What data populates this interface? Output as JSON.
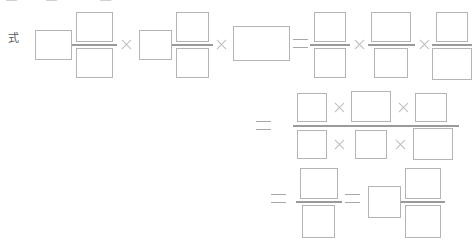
{
  "page": {
    "background_color": "#ffffff",
    "box_border_color": "#b4b4b4",
    "rule_color": "#9a9a9a",
    "operator_color": "#bdbdbd",
    "label_color": "#5b5b5b"
  },
  "top_clipped_text": "—  一    —  一一  —一",
  "row_label": {
    "text": "式",
    "meaning": "formula"
  },
  "glyphs": {
    "multiply": "×",
    "equals": "=",
    "blank_box": "□"
  },
  "worksheet": {
    "kind": "fill-in-the-blank arithmetic worked solution",
    "all_values_blank": true,
    "lines": [
      {
        "id": "line-1",
        "label": "式",
        "expression_text": "□ □/□ × □ □/□ × □ = □/□ × □/□ × □/□",
        "terms": [
          {
            "type": "mixed-number",
            "whole": "",
            "numerator": "",
            "denominator": ""
          },
          {
            "type": "operator",
            "value": "×"
          },
          {
            "type": "mixed-number",
            "whole": "",
            "numerator": "",
            "denominator": ""
          },
          {
            "type": "operator",
            "value": "×"
          },
          {
            "type": "box",
            "value": ""
          },
          {
            "type": "operator",
            "value": "="
          },
          {
            "type": "fraction",
            "numerator": "",
            "denominator": ""
          },
          {
            "type": "operator",
            "value": "×"
          },
          {
            "type": "fraction",
            "numerator": "",
            "denominator": ""
          },
          {
            "type": "operator",
            "value": "×"
          },
          {
            "type": "fraction",
            "numerator": "",
            "denominator": ""
          }
        ]
      },
      {
        "id": "line-2",
        "label": "",
        "expression_text": "= (□ × □ × □) / (□ × □ × □)",
        "terms": [
          {
            "type": "operator",
            "value": "="
          },
          {
            "type": "compound-fraction",
            "numerator_factors": [
              "",
              "",
              ""
            ],
            "denominator_factors": [
              "",
              "",
              ""
            ],
            "factor_operator": "×"
          }
        ]
      },
      {
        "id": "line-3",
        "label": "",
        "expression_text": "= □/□ = □ □/□",
        "terms": [
          {
            "type": "operator",
            "value": "="
          },
          {
            "type": "fraction",
            "numerator": "",
            "denominator": ""
          },
          {
            "type": "operator",
            "value": "="
          },
          {
            "type": "mixed-number",
            "whole": "",
            "numerator": "",
            "denominator": ""
          }
        ]
      }
    ]
  }
}
